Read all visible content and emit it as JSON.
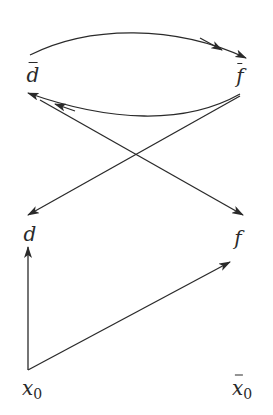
{
  "diagram": {
    "type": "commutative-diagram",
    "stroke_color": "#2a2a2a",
    "nodes": [
      {
        "id": "dbar",
        "label": "d",
        "overbar": true,
        "subscript": "",
        "x": 33,
        "y": 75
      },
      {
        "id": "fbar",
        "label": "f",
        "overbar": true,
        "subscript": "",
        "x": 240,
        "y": 76
      },
      {
        "id": "d",
        "label": "d",
        "overbar": false,
        "subscript": "",
        "x": 30,
        "y": 234
      },
      {
        "id": "f",
        "label": "f",
        "overbar": false,
        "subscript": "",
        "x": 238,
        "y": 238
      },
      {
        "id": "x0",
        "label": "x",
        "overbar": false,
        "subscript": "0",
        "x": 30,
        "y": 390
      },
      {
        "id": "x0bar",
        "label": "x",
        "overbar": true,
        "subscript": "0",
        "x": 240,
        "y": 390
      }
    ],
    "edges": [
      {
        "id": "dbar-to-fbar",
        "from": "dbar",
        "to": "fbar",
        "style": "curved-up",
        "double_head": true
      },
      {
        "id": "fbar-to-dbar",
        "from": "fbar",
        "to": "dbar",
        "style": "curved-down",
        "double_head": true
      },
      {
        "id": "fbar-to-d",
        "from": "fbar",
        "to": "d",
        "style": "straight",
        "double_head": false
      },
      {
        "id": "dbar-to-f",
        "from": "dbar",
        "to": "f",
        "style": "straight",
        "double_head": false
      },
      {
        "id": "x0-to-d",
        "from": "x0",
        "to": "d",
        "style": "straight",
        "double_head": false
      },
      {
        "id": "x0-to-f",
        "from": "x0",
        "to": "f",
        "style": "straight",
        "double_head": false
      }
    ]
  },
  "labels": {
    "dbar": "d",
    "fbar": "f",
    "d": "d",
    "f": "f",
    "x0_base": "x",
    "x0_sub": "0",
    "x0bar_base": "x",
    "x0bar_sub": "0"
  }
}
